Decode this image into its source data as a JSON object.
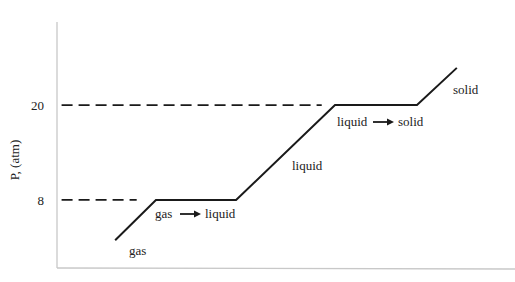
{
  "chart_data": {
    "type": "line",
    "title": "",
    "xlabel": "",
    "ylabel": "P, (atm)",
    "xlim": [
      0,
      100
    ],
    "ylim": [
      -0.6,
      30.5
    ],
    "grid": false,
    "legend": "none",
    "yticks": [
      {
        "value": 20,
        "label": "20"
      },
      {
        "value": 8,
        "label": "8"
      }
    ],
    "series": [
      {
        "name": "phase-curve",
        "x": [
          12.7,
          21.6,
          39.1,
          60.7,
          78.6,
          87.3
        ],
        "y": [
          2.9,
          8,
          8,
          20,
          20,
          24.7
        ]
      }
    ],
    "reference_lines": [
      {
        "name": "dashed-20",
        "y": 20,
        "x_from": 1,
        "x_to": 57.8,
        "style": "dashed"
      },
      {
        "name": "dashed-8",
        "y": 8,
        "x_from": 1,
        "x_to": 17.4,
        "style": "dashed"
      }
    ],
    "annotations": [
      {
        "name": "gas",
        "text": "gas",
        "x": 15.7,
        "y": 0.7
      },
      {
        "name": "gas-to-liquid",
        "text_from": "gas",
        "text_to": "liquid",
        "x": 21.4,
        "y": 5.3
      },
      {
        "name": "liquid",
        "text": "liquid",
        "x": 51.3,
        "y": 11.4
      },
      {
        "name": "liquid-to-solid",
        "text_from": "liquid",
        "text_to": "solid",
        "x": 62.7,
        "y": 17.3
      },
      {
        "name": "solid",
        "text": "solid",
        "x": 87.8,
        "y": 21.6
      }
    ]
  },
  "colors": {
    "curve": "#1a1a1a",
    "dashed": "#1a1a1a",
    "axis": "#c8c8c8",
    "text": "#222222"
  }
}
